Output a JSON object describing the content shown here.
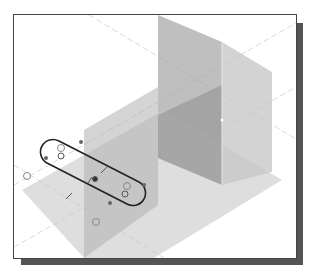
{
  "viewport": {
    "description": "3D CAD graphics window with datum planes and sketched slot",
    "background": "#ffffff",
    "frame_color": "#444444",
    "shadow_color": "#555555"
  },
  "datum_planes": [
    {
      "name": "horizontal-plane",
      "fill": "#bdbdbd"
    },
    {
      "name": "back-vertical-plane",
      "fill": "#a8a8a8"
    },
    {
      "name": "front-vertical-plane",
      "fill": "#b5b5b5"
    }
  ],
  "sketch": {
    "shape": "slot",
    "stroke": "#222222",
    "constraint_glyph_color": "#555555"
  }
}
